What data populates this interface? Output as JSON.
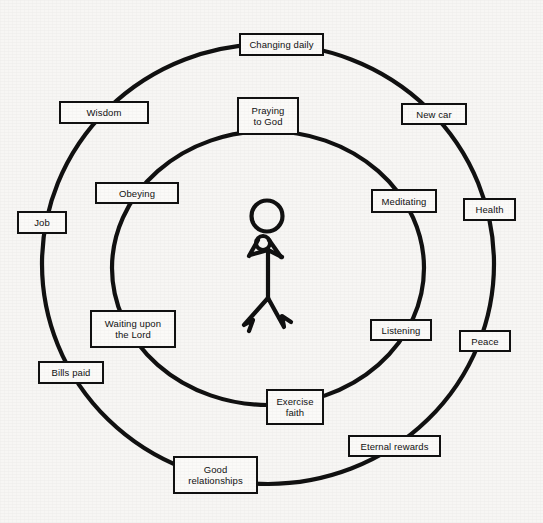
{
  "diagram": {
    "type": "concentric-circles",
    "background_color": "#f7f6f4",
    "line_color": "#111111",
    "box_fill_color": "#fbfaf8",
    "center_figure": {
      "name": "praying stick figure",
      "description": "stick figure with round head, clasped hands and spread legs"
    },
    "inner_circle": {
      "label": "inner ring",
      "center_x": 268,
      "center_y": 268,
      "radius": 137,
      "nodes": [
        {
          "id": "praying-to-god",
          "label": "Praying\nto God",
          "angle_deg": -90,
          "x": 237,
          "y": 97,
          "w": 62,
          "h": 38
        },
        {
          "id": "meditating",
          "label": "Meditating",
          "angle_deg": -40,
          "x": 371,
          "y": 189,
          "w": 66,
          "h": 24
        },
        {
          "id": "listening",
          "label": "Listening",
          "angle_deg": 37,
          "x": 370,
          "y": 319,
          "w": 62,
          "h": 22
        },
        {
          "id": "exercise-faith",
          "label": "Exercise\nfaith",
          "angle_deg": 80,
          "x": 266,
          "y": 389,
          "w": 58,
          "h": 36
        },
        {
          "id": "waiting-upon-the-lord",
          "label": "Waiting upon\nthe Lord",
          "angle_deg": 142,
          "x": 90,
          "y": 310,
          "w": 86,
          "h": 38
        },
        {
          "id": "obeying",
          "label": "Obeying",
          "angle_deg": -143,
          "x": 95,
          "y": 182,
          "w": 84,
          "h": 22
        }
      ]
    },
    "outer_circle": {
      "label": "outer ring",
      "center_x": 268,
      "center_y": 264,
      "radius": 226,
      "nodes": [
        {
          "id": "changing-daily",
          "label": "Changing daily",
          "angle_deg": -84,
          "x": 239,
          "y": 33,
          "w": 85,
          "h": 23
        },
        {
          "id": "new-car",
          "label": "New car",
          "angle_deg": -45,
          "x": 401,
          "y": 103,
          "w": 66,
          "h": 22
        },
        {
          "id": "health",
          "label": "Health",
          "angle_deg": -8,
          "x": 463,
          "y": 198,
          "w": 53,
          "h": 23
        },
        {
          "id": "peace",
          "label": "Peace",
          "angle_deg": 28,
          "x": 459,
          "y": 330,
          "w": 52,
          "h": 22
        },
        {
          "id": "eternal-rewards",
          "label": "Eternal rewards",
          "angle_deg": 57,
          "x": 348,
          "y": 435,
          "w": 93,
          "h": 22
        },
        {
          "id": "good-relationships",
          "label": "Good\nrelationships",
          "angle_deg": 97,
          "x": 173,
          "y": 456,
          "w": 85,
          "h": 38
        },
        {
          "id": "bills-paid",
          "label": "Bills paid",
          "angle_deg": 148,
          "x": 38,
          "y": 361,
          "w": 66,
          "h": 23
        },
        {
          "id": "job",
          "label": "Job",
          "angle_deg": 178,
          "x": 17,
          "y": 211,
          "w": 50,
          "h": 23
        },
        {
          "id": "wisdom",
          "label": "Wisdom",
          "angle_deg": -132,
          "x": 59,
          "y": 101,
          "w": 90,
          "h": 23
        }
      ]
    }
  }
}
